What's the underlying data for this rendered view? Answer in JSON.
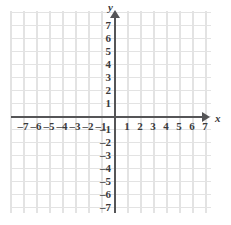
{
  "figure": {
    "kind": "cartesian-coordinate-plane",
    "background_color": "#ffffff",
    "grid_color": "#e3e3e3",
    "axis_color": "#555557",
    "label_color": "#3a3a3c"
  },
  "axes": {
    "x": {
      "name": "x",
      "ticks": [
        "–7",
        "–6",
        "–5",
        "–4",
        "–3",
        "–2",
        "–1",
        "1",
        "2",
        "3",
        "4",
        "5",
        "6",
        "7"
      ],
      "tick_values": [
        -7,
        -6,
        -5,
        -4,
        -3,
        -2,
        -1,
        1,
        2,
        3,
        4,
        5,
        6,
        7
      ],
      "arrow": "right-arrowhead"
    },
    "y": {
      "name": "y",
      "ticks": [
        "7",
        "6",
        "5",
        "4",
        "3",
        "2",
        "1",
        "–1",
        "–2",
        "–3",
        "–4",
        "–5",
        "–6",
        "–7"
      ],
      "tick_values": [
        7,
        6,
        5,
        4,
        3,
        2,
        1,
        -1,
        -2,
        -3,
        -4,
        -5,
        -6,
        -7
      ],
      "arrow": "up-arrowhead"
    }
  },
  "chart_data": {
    "type": "scatter",
    "title": "",
    "subtitle": "",
    "xlabel": "x",
    "ylabel": "y",
    "xlim": [
      -7.9,
      7.4
    ],
    "ylim": [
      -7.8,
      7.7
    ],
    "xticks": [
      -7,
      -6,
      -5,
      -4,
      -3,
      -2,
      -1,
      1,
      2,
      3,
      4,
      5,
      6,
      7
    ],
    "yticks": [
      -7,
      -6,
      -5,
      -4,
      -3,
      -2,
      -1,
      1,
      2,
      3,
      4,
      5,
      6,
      7
    ],
    "xticklabels": [
      "–7",
      "–6",
      "–5",
      "–4",
      "–3",
      "–2",
      "–1",
      "1",
      "2",
      "3",
      "4",
      "5",
      "6",
      "7"
    ],
    "yticklabels": [
      "–7",
      "–6",
      "–5",
      "–4",
      "–3",
      "–2",
      "–1",
      "1",
      "2",
      "3",
      "4",
      "5",
      "6",
      "7"
    ],
    "grid": true,
    "grid_step": 1,
    "legend": null,
    "series": [],
    "values": [],
    "annotations": []
  }
}
